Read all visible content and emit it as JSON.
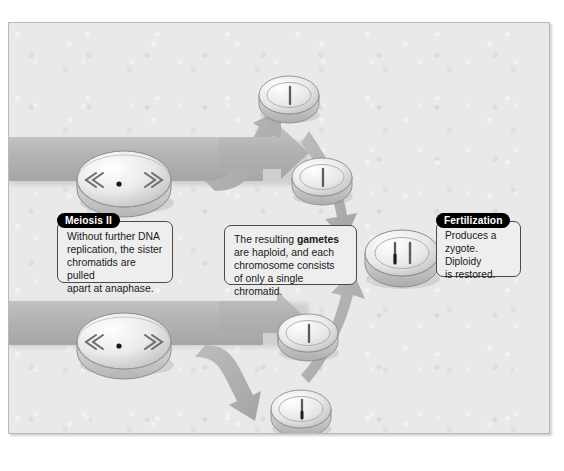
{
  "figure": {
    "background_color": "#e9e9e9",
    "border_color": "#b9b9b9",
    "arrow_color": "#b0b0b0"
  },
  "callouts": [
    {
      "id": "meiosis2",
      "badge": "Meiosis II",
      "lines": [
        "Without further DNA",
        "replication, the sister",
        "chromatids are pulled",
        "apart at anaphase."
      ]
    },
    {
      "id": "gametes",
      "badge": null,
      "lines_html": [
        "The resulting <b>gametes</b>",
        "are haploid, and each",
        "chromosome consists",
        "of only a single chromatid."
      ],
      "lines": [
        "The resulting gametes",
        "are haploid, and each",
        "chromosome consists",
        "of only a single chromatid."
      ]
    },
    {
      "id": "fertilization",
      "badge": "Fertilization",
      "lines": [
        "Produces a",
        "zygote. Diploidy",
        "is restored."
      ]
    }
  ],
  "cells": [
    {
      "id": "anaphase-top",
      "name": "anaphase-ii-cell-top",
      "stage": "anaphase II",
      "chromatids": 2,
      "arrows": true,
      "centromere_dot": true
    },
    {
      "id": "anaphase-bottom",
      "name": "anaphase-ii-cell-bottom",
      "stage": "anaphase II",
      "chromatids": 2,
      "arrows": true,
      "centromere_dot": true
    },
    {
      "id": "gamete-1",
      "name": "haploid-gamete-cell-1",
      "stage": "gamete",
      "chromatids": 1,
      "arrows": false,
      "centromere_dot": false
    },
    {
      "id": "gamete-2",
      "name": "haploid-gamete-cell-2",
      "stage": "gamete",
      "chromatids": 1,
      "arrows": false,
      "centromere_dot": false
    },
    {
      "id": "gamete-3",
      "name": "haploid-gamete-cell-3",
      "stage": "gamete",
      "chromatids": 1,
      "arrows": false,
      "centromere_dot": false
    },
    {
      "id": "gamete-4",
      "name": "haploid-gamete-cell-4",
      "stage": "gamete",
      "chromatids": 1,
      "arrows": false,
      "centromere_dot": true
    },
    {
      "id": "zygote",
      "name": "diploid-zygote-cell",
      "stage": "zygote",
      "chromatids": 2,
      "arrows": false,
      "centromere_dot": true
    }
  ]
}
